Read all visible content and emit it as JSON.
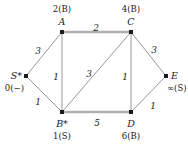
{
  "figure": {
    "type": "weighted-undirected-graph",
    "caption": "",
    "colors": {
      "edge_thin": "#8a8a8a",
      "edge_thick": "#b0b0b0",
      "node_fill": "#1a1a1a",
      "text": "#1a1a1a"
    }
  },
  "nodes": [
    {
      "id": "S",
      "name": "S*",
      "dist": "0(−)",
      "x": 26,
      "y": 76,
      "name_pos": "left",
      "dist_pos": "below-left"
    },
    {
      "id": "A",
      "name": "A",
      "dist": "2(B)",
      "x": 62,
      "y": 32,
      "name_pos": "above",
      "dist_pos": "above"
    },
    {
      "id": "C",
      "name": "C",
      "dist": "4(B)",
      "x": 131,
      "y": 32,
      "name_pos": "above",
      "dist_pos": "above"
    },
    {
      "id": "B",
      "name": "B*",
      "dist": "1(S)",
      "x": 62,
      "y": 112,
      "name_pos": "below",
      "dist_pos": "below"
    },
    {
      "id": "D",
      "name": "D",
      "dist": "6(B)",
      "x": 131,
      "y": 112,
      "name_pos": "below",
      "dist_pos": "below"
    },
    {
      "id": "E",
      "name": "E",
      "dist": "∞(S)",
      "x": 166,
      "y": 76,
      "name_pos": "right",
      "dist_pos": "below-right"
    }
  ],
  "edges": [
    {
      "from": "S",
      "to": "A",
      "weight": "3",
      "style": "thin",
      "label_x": 38,
      "label_y": 47
    },
    {
      "from": "S",
      "to": "B",
      "weight": "1",
      "style": "thin",
      "label_x": 38,
      "label_y": 98
    },
    {
      "from": "A",
      "to": "C",
      "weight": "2",
      "style": "thick",
      "label_x": 96,
      "label_y": 24
    },
    {
      "from": "A",
      "to": "B",
      "weight": "1",
      "style": "thin",
      "label_x": 56,
      "label_y": 73
    },
    {
      "from": "B",
      "to": "C",
      "weight": "3",
      "style": "thin",
      "label_x": 89,
      "label_y": 70
    },
    {
      "from": "B",
      "to": "D",
      "weight": "5",
      "style": "thick",
      "label_x": 97,
      "label_y": 119
    },
    {
      "from": "C",
      "to": "D",
      "weight": "1",
      "style": "thin",
      "label_x": 125,
      "label_y": 73
    },
    {
      "from": "C",
      "to": "E",
      "weight": "3",
      "style": "thin",
      "label_x": 154,
      "label_y": 46
    },
    {
      "from": "D",
      "to": "E",
      "weight": "1",
      "style": "thin",
      "label_x": 153,
      "label_y": 102
    }
  ]
}
